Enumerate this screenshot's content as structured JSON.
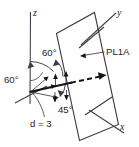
{
  "figure": {
    "background_color": "#ffffff",
    "line_color": "#3c3c46",
    "emphasis_color": "#14141a",
    "axes": {
      "x_label": "x",
      "y_label": "y",
      "z_label": "z"
    },
    "plane": {
      "name_label": "PL1A"
    },
    "angles": {
      "upper_label": "60°",
      "left_label": "60°",
      "lower_label": "45°"
    },
    "distance": {
      "label": "d = 3"
    }
  }
}
